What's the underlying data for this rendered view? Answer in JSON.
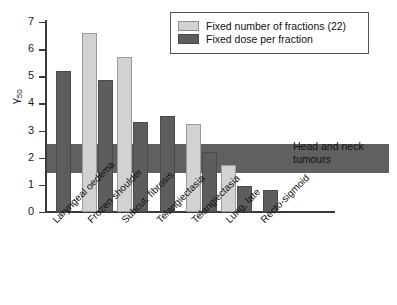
{
  "chart_data": {
    "type": "bar",
    "title": "",
    "xlabel": "",
    "ylabel": "γ₅₀",
    "ylabel_base": "γ",
    "ylabel_sub": "50",
    "ylim": [
      0,
      7
    ],
    "yticks": [
      0,
      1,
      2,
      3,
      4,
      5,
      6,
      7
    ],
    "ytick_labels": [
      "0",
      "1",
      "2",
      "3",
      "4",
      "5",
      "6",
      "7"
    ],
    "grid": false,
    "legend_position": "top-right",
    "categories": [
      "Laryngeal oedema",
      "Frozen shoulder",
      "Subcut. fibrosis",
      "Telangiectasia",
      "Telangiectasia",
      "Lung, late",
      "Recto-sigmoid"
    ],
    "series": [
      {
        "name": "Fixed number of fractions (22)",
        "color": "#d2d2d2",
        "values": [
          null,
          6.6,
          5.7,
          null,
          3.25,
          1.75,
          null
        ]
      },
      {
        "name": "Fixed dose per fraction",
        "color": "#5d5d5d",
        "values": [
          5.2,
          4.85,
          3.3,
          3.55,
          2.2,
          0.95,
          0.8
        ]
      }
    ],
    "reference_band": {
      "label": "Head and neck tumours",
      "color": "#525252",
      "y_min": 1.45,
      "y_max": 2.5
    }
  },
  "legend": {
    "items": [
      {
        "label": "Fixed number of fractions (22)",
        "swatch": "light"
      },
      {
        "label": "Fixed dose per fraction",
        "swatch": "dark"
      }
    ]
  },
  "annotation": {
    "line1": "Head and neck",
    "line2": "tumours"
  }
}
